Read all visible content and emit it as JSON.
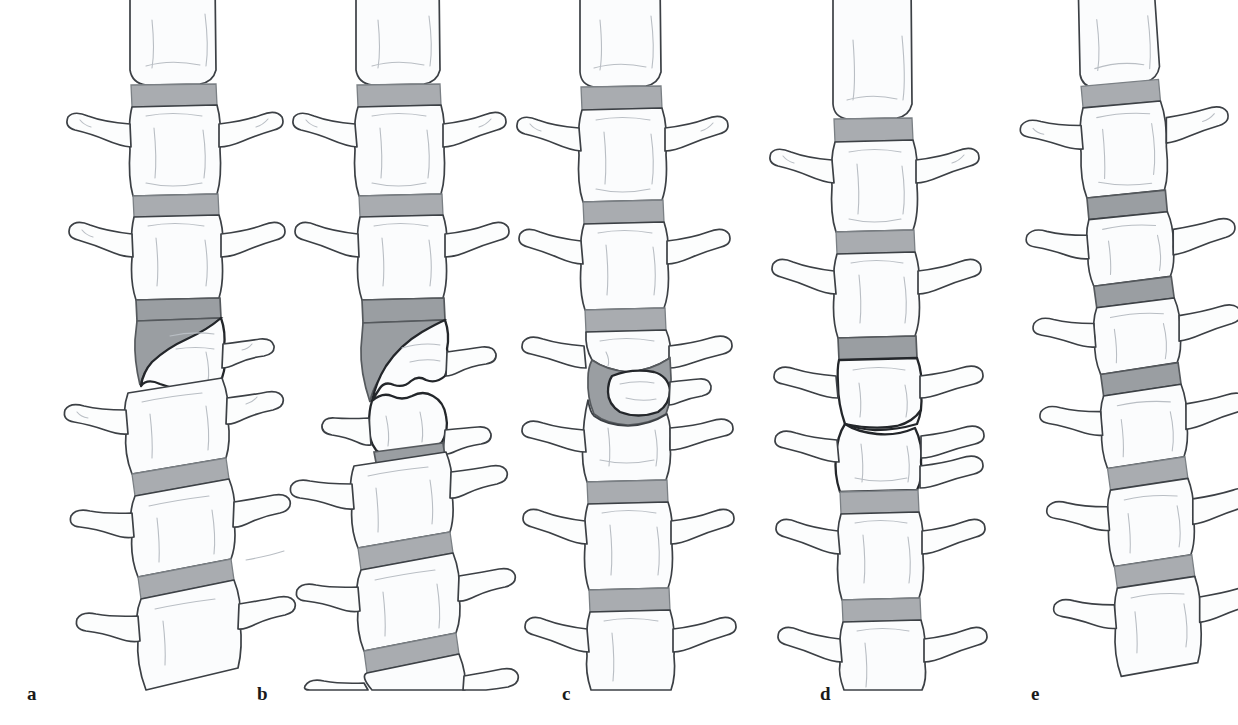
{
  "figure": {
    "background_color": "#ffffff",
    "ink_color": "#3c4045",
    "disc_color": "#a9acb0",
    "vertebral_body_color": "#fbfcfd",
    "panel_count": 5,
    "style": "pen-and-ink medical line drawing, lateral view of thoracolumbar spine"
  },
  "captions": {
    "a": "a",
    "b": "b",
    "c": "c",
    "d": "d",
    "e": "e"
  },
  "panels": [
    {
      "id": "a",
      "label": "a",
      "deformity": "anterior wedge deformity",
      "description": "Wedge-shaped vertebral body with loss of anterior height; thickened grey disc space wedging anteriorly",
      "column_tilt": "lower segment deviates to the left",
      "vertebra_count": 7,
      "disc_count": 6,
      "affected_level_index": 3
    },
    {
      "id": "b",
      "label": "b",
      "deformity": "crush / complete collapse deformity",
      "description": "Severely crushed vertebral body with irregular fragmented endplates and marked loss of overall height",
      "column_tilt": "lower segment deviates to the left",
      "vertebra_count": 7,
      "disc_count": 6,
      "affected_level_index": 3
    },
    {
      "id": "c",
      "label": "c",
      "deformity": "biconcave (codfish) deformity",
      "description": "Central depression of both endplates producing a U-shaped grey disc; anterior and posterior heights preserved",
      "column_tilt": "straight vertical column",
      "vertebra_count": 7,
      "disc_count": 6,
      "affected_level_index": 3
    },
    {
      "id": "d",
      "label": "d",
      "deformity": "intervertebral disc space loss with endplate apposition",
      "description": "Two adjacent vertebral bodies in direct contact with an oblique interface; no grey disc visible at the affected level",
      "column_tilt": "straight vertical column",
      "vertebra_count": 7,
      "disc_count": 5,
      "affected_level_index": 3
    },
    {
      "id": "e",
      "label": "e",
      "deformity": "scoliotic angulation with short wedged segments",
      "description": "Laterally angulated column with obliquely oriented narrow vertebral bodies and tilted grey disc spaces",
      "column_tilt": "S-shaped lateral curvature, apex to the right",
      "vertebra_count": 7,
      "disc_count": 6,
      "affected_level_index": 3
    }
  ]
}
